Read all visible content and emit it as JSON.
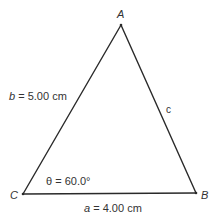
{
  "diagram": {
    "type": "triangle",
    "stroke_color": "#2a2a2a",
    "vertices": {
      "A": {
        "label": "A",
        "x": 121,
        "y": 25
      },
      "B": {
        "label": "B",
        "x": 196,
        "y": 193
      },
      "C": {
        "label": "C",
        "x": 23,
        "y": 194
      }
    },
    "sides": {
      "a": {
        "var": "a",
        "eq": "=",
        "value": "4.00 cm",
        "between": [
          "C",
          "B"
        ]
      },
      "b": {
        "var": "b",
        "eq": "=",
        "value": "5.00 cm",
        "between": [
          "C",
          "A"
        ]
      },
      "c": {
        "var": "c",
        "between": [
          "A",
          "B"
        ]
      }
    },
    "angle": {
      "var": "θ",
      "eq": "=",
      "value": "60.0°",
      "at": "C"
    }
  }
}
